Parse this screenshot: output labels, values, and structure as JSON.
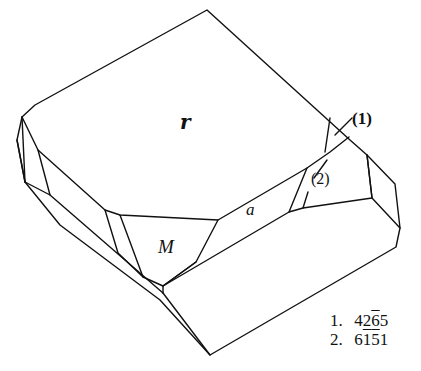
{
  "figure": {
    "type": "crystal-drawing",
    "face_labels": {
      "r": "r",
      "a": "a",
      "M": "M"
    },
    "callouts": {
      "one": "(1)",
      "two": "(2)"
    },
    "legend": [
      {
        "num": "1.",
        "parts": [
          "4",
          "2",
          "6",
          "5"
        ],
        "overlined": [
          false,
          false,
          true,
          false
        ]
      },
      {
        "num": "2.",
        "parts": [
          "6",
          "1",
          "5",
          "1"
        ],
        "overlined": [
          false,
          true,
          true,
          false
        ]
      }
    ],
    "colors": {
      "line": "#111111",
      "background": "#ffffff"
    }
  }
}
